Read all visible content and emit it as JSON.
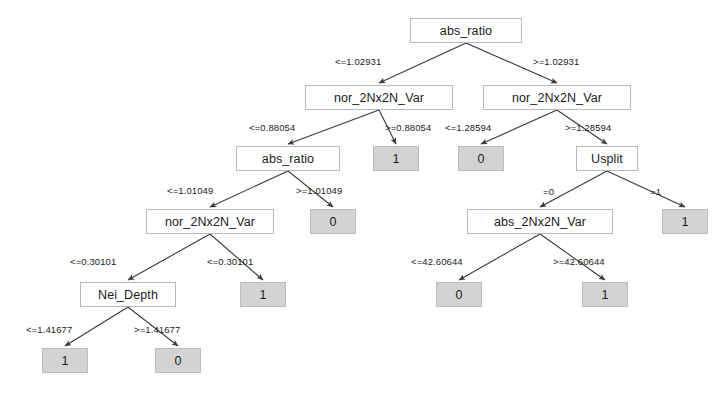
{
  "figure": {
    "type": "decision-tree",
    "background_color": "#ffffff",
    "decision_node_fill": "#ffffff",
    "decision_node_border": "#b9b9b9",
    "leaf_node_fill": "#d3d3d3",
    "leaf_node_border": "#bdbdbd",
    "edge_color": "#3a3a3a",
    "text_color": "#1b1b1b"
  },
  "nodes": [
    {
      "id": "n0",
      "kind": "decision",
      "label": "abs_ratio",
      "x": 410,
      "y": 18,
      "w": 112
    },
    {
      "id": "n1",
      "kind": "decision",
      "label": "nor_2Nx2N_Var",
      "x": 305,
      "y": 85,
      "w": 148
    },
    {
      "id": "n2",
      "kind": "decision",
      "label": "nor_2Nx2N_Var",
      "x": 483,
      "y": 85,
      "w": 148
    },
    {
      "id": "n3",
      "kind": "decision",
      "label": "abs_ratio",
      "x": 236,
      "y": 146,
      "w": 104
    },
    {
      "id": "n4",
      "kind": "leaf",
      "label": "1",
      "x": 373,
      "y": 146,
      "w": 46
    },
    {
      "id": "n5",
      "kind": "leaf",
      "label": "0",
      "x": 458,
      "y": 146,
      "w": 46
    },
    {
      "id": "n6",
      "kind": "decision",
      "label": "Usplit",
      "x": 576,
      "y": 146,
      "w": 62
    },
    {
      "id": "n7",
      "kind": "decision",
      "label": "nor_2Nx2N_Var",
      "x": 146,
      "y": 209,
      "w": 128
    },
    {
      "id": "n8",
      "kind": "leaf",
      "label": "0",
      "x": 310,
      "y": 209,
      "w": 46
    },
    {
      "id": "n9",
      "kind": "decision",
      "label": "abs_2Nx2N_Var",
      "x": 467,
      "y": 209,
      "w": 146
    },
    {
      "id": "n10",
      "kind": "leaf",
      "label": "1",
      "x": 662,
      "y": 209,
      "w": 46
    },
    {
      "id": "n11",
      "kind": "decision",
      "label": "Nei_Depth",
      "x": 80,
      "y": 282,
      "w": 96
    },
    {
      "id": "n12",
      "kind": "leaf",
      "label": "1",
      "x": 240,
      "y": 282,
      "w": 46
    },
    {
      "id": "n13",
      "kind": "leaf",
      "label": "0",
      "x": 436,
      "y": 282,
      "w": 46
    },
    {
      "id": "n14",
      "kind": "leaf",
      "label": "1",
      "x": 582,
      "y": 282,
      "w": 46
    },
    {
      "id": "n15",
      "kind": "leaf",
      "label": "1",
      "x": 42,
      "y": 348,
      "w": 46
    },
    {
      "id": "n16",
      "kind": "leaf",
      "label": "0",
      "x": 155,
      "y": 348,
      "w": 46
    }
  ],
  "edges": [
    {
      "from": "n0",
      "to": "n1",
      "label": "<=1.02931",
      "lx": 335,
      "ly": 56
    },
    {
      "from": "n0",
      "to": "n2",
      "label": ">=1.02931",
      "lx": 533,
      "ly": 56
    },
    {
      "from": "n1",
      "to": "n3",
      "label": "<=0.88054",
      "lx": 249,
      "ly": 122
    },
    {
      "from": "n1",
      "to": "n4",
      "label": ">=0.88054",
      "lx": 385,
      "ly": 122
    },
    {
      "from": "n2",
      "to": "n5",
      "label": "<=1.28594",
      "lx": 445,
      "ly": 122
    },
    {
      "from": "n2",
      "to": "n6",
      "label": ">=1.28594",
      "lx": 565,
      "ly": 122
    },
    {
      "from": "n3",
      "to": "n7",
      "label": "<=1.01049",
      "lx": 167,
      "ly": 185
    },
    {
      "from": "n3",
      "to": "n8",
      "label": ">=1.01049",
      "lx": 296,
      "ly": 185
    },
    {
      "from": "n6",
      "to": "n9",
      "label": "=0",
      "lx": 543,
      "ly": 186
    },
    {
      "from": "n6",
      "to": "n10",
      "label": "=1",
      "lx": 650,
      "ly": 186
    },
    {
      "from": "n7",
      "to": "n11",
      "label": "<=0.30101",
      "lx": 70,
      "ly": 256
    },
    {
      "from": "n7",
      "to": "n12",
      "label": "<=0.30101",
      "lx": 207,
      "ly": 256
    },
    {
      "from": "n9",
      "to": "n13",
      "label": "<=42.60644",
      "lx": 411,
      "ly": 256
    },
    {
      "from": "n9",
      "to": "n14",
      "label": ">=42.60644",
      "lx": 553,
      "ly": 256
    },
    {
      "from": "n11",
      "to": "n15",
      "label": "<=1.41677",
      "lx": 26,
      "ly": 324
    },
    {
      "from": "n11",
      "to": "n16",
      "label": ">=1.41677",
      "lx": 134,
      "ly": 324
    }
  ]
}
